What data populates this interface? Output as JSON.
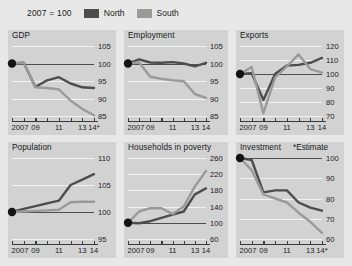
{
  "legend": {
    "base_label": "2007 = 100",
    "entries": [
      {
        "name": "North",
        "color": "#4d4d4d"
      },
      {
        "name": "South",
        "color": "#9a9a9a"
      }
    ]
  },
  "annotations": {
    "estimate_note": "*Estimate"
  },
  "colors": {
    "north": "#4d4d4d",
    "south": "#9a9a9a",
    "panel_bg": "#d2d2d2",
    "page_bg": "#e8e8e8",
    "grid": "#f2f2f2",
    "axis": "#3a3a3a"
  },
  "chart_data": [
    {
      "type": "line",
      "title": "GDP",
      "xlabel": "",
      "ylabel": "",
      "x": [
        2007,
        2008,
        2009,
        2010,
        2011,
        2012,
        2013,
        2014
      ],
      "xtick_labels": [
        "2007",
        "",
        "09",
        "",
        "11",
        "",
        "13",
        "14*"
      ],
      "ylim": [
        85,
        105
      ],
      "yticks": [
        85,
        90,
        95,
        100,
        105
      ],
      "grid": true,
      "baseline": 100,
      "start_marker": {
        "x": 2007,
        "y": 100
      },
      "series": [
        {
          "name": "North",
          "color": "#4d4d4d",
          "values": [
            100,
            100.2,
            93.3,
            95.2,
            96.1,
            94.3,
            93.2,
            93.0
          ]
        },
        {
          "name": "South",
          "color": "#9a9a9a",
          "values": [
            100,
            100.2,
            93.2,
            93.0,
            92.6,
            89.4,
            87.0,
            85.2
          ]
        }
      ]
    },
    {
      "type": "line",
      "title": "Employment",
      "xlabel": "",
      "ylabel": "",
      "x": [
        2007,
        2008,
        2009,
        2010,
        2011,
        2012,
        2013,
        2014
      ],
      "xtick_labels": [
        "2007",
        "",
        "09",
        "",
        "11",
        "",
        "13",
        "14"
      ],
      "ylim": [
        85,
        105
      ],
      "yticks": [
        85,
        90,
        95,
        100,
        105
      ],
      "grid": true,
      "baseline": 100,
      "start_marker": {
        "x": 2007,
        "y": 100
      },
      "series": [
        {
          "name": "North",
          "color": "#4d4d4d",
          "values": [
            100,
            101.2,
            100.3,
            100.2,
            100.4,
            100.0,
            99.2,
            100.2
          ]
        },
        {
          "name": "South",
          "color": "#9a9a9a",
          "values": [
            100,
            100.3,
            96.2,
            95.6,
            95.2,
            94.9,
            91.3,
            90.2
          ]
        }
      ]
    },
    {
      "type": "line",
      "title": "Exports",
      "xlabel": "",
      "ylabel": "",
      "x": [
        2007,
        2008,
        2009,
        2010,
        2011,
        2012,
        2013,
        2014
      ],
      "xtick_labels": [
        "2007",
        "",
        "09",
        "",
        "11",
        "",
        "13",
        "14"
      ],
      "ylim": [
        70,
        120
      ],
      "yticks": [
        70,
        80,
        90,
        100,
        110,
        120
      ],
      "grid": true,
      "baseline": 100,
      "start_marker": {
        "x": 2007,
        "y": 100
      },
      "series": [
        {
          "name": "North",
          "color": "#4d4d4d",
          "values": [
            100,
            100.5,
            81.5,
            100.0,
            106.0,
            106.5,
            108.0,
            111.5
          ]
        },
        {
          "name": "South",
          "color": "#9a9a9a",
          "values": [
            100,
            105.0,
            72.0,
            97.5,
            105.5,
            114.0,
            103.5,
            101.0
          ]
        }
      ]
    },
    {
      "type": "line",
      "title": "Population",
      "xlabel": "",
      "ylabel": "",
      "x": [
        2007,
        2008,
        2009,
        2010,
        2011,
        2012,
        2013,
        2014
      ],
      "xtick_labels": [
        "2007",
        "",
        "09",
        "",
        "11",
        "",
        "13",
        "14"
      ],
      "ylim": [
        95,
        110
      ],
      "yticks": [
        95,
        100,
        105,
        110
      ],
      "grid": true,
      "baseline": 100,
      "start_marker": {
        "x": 2007,
        "y": 100
      },
      "series": [
        {
          "name": "North",
          "color": "#4d4d4d",
          "values": [
            100,
            100.6,
            101.1,
            101.6,
            102.1,
            105.0,
            106.0,
            107.0
          ]
        },
        {
          "name": "South",
          "color": "#9a9a9a",
          "values": [
            100,
            100.1,
            100.2,
            100.3,
            100.4,
            101.8,
            101.9,
            101.9
          ]
        }
      ]
    },
    {
      "type": "line",
      "title": "Households in poverty",
      "xlabel": "",
      "ylabel": "",
      "x": [
        2007,
        2008,
        2009,
        2010,
        2011,
        2012,
        2013,
        2014
      ],
      "xtick_labels": [
        "2007",
        "",
        "09",
        "",
        "11",
        "",
        "13",
        "14"
      ],
      "ylim": [
        60,
        260
      ],
      "yticks": [
        60,
        100,
        140,
        180,
        220,
        260
      ],
      "grid": true,
      "baseline": 100,
      "start_marker": {
        "x": 2007,
        "y": 100
      },
      "series": [
        {
          "name": "North",
          "color": "#4d4d4d",
          "values": [
            100,
            99,
            104,
            112,
            120,
            128,
            170,
            185
          ]
        },
        {
          "name": "South",
          "color": "#9a9a9a",
          "values": [
            100,
            128,
            136,
            136,
            122,
            140,
            190,
            228
          ]
        }
      ]
    },
    {
      "type": "line",
      "title": "Investment",
      "xlabel": "",
      "ylabel": "",
      "x": [
        2007,
        2008,
        2009,
        2010,
        2011,
        2012,
        2013,
        2014
      ],
      "xtick_labels": [
        "2007",
        "",
        "09",
        "",
        "11",
        "",
        "13",
        "14*"
      ],
      "ylim": [
        60,
        100
      ],
      "yticks": [
        60,
        70,
        80,
        90,
        100
      ],
      "grid": true,
      "baseline": 100,
      "start_marker": {
        "x": 2007,
        "y": 100
      },
      "series": [
        {
          "name": "North",
          "color": "#4d4d4d",
          "values": [
            100,
            99.0,
            83.0,
            84.0,
            84.0,
            78.0,
            75.5,
            74.0
          ]
        },
        {
          "name": "South",
          "color": "#9a9a9a",
          "values": [
            100,
            94.0,
            82.0,
            80.0,
            78.0,
            73.0,
            68.5,
            63.0
          ]
        }
      ]
    }
  ]
}
